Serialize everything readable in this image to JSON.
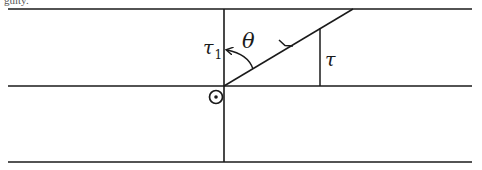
{
  "caption": "guity.",
  "diagram": {
    "labels": {
      "theta": "θ",
      "tau1_main": "τ",
      "tau1_sub": "1",
      "tau": "τ"
    },
    "elements": {
      "horizontal_lines": [
        {
          "name": "top-boundary",
          "y": 9,
          "x1": 8,
          "x2": 472
        },
        {
          "name": "middle-boundary",
          "y": 86,
          "x1": 8,
          "x2": 472
        },
        {
          "name": "bottom-boundary",
          "y": 162,
          "x1": 8,
          "x2": 472
        }
      ],
      "vertical_axis": {
        "x": 224,
        "y1": 9,
        "y2": 162
      },
      "diagonal_ray": {
        "x1": 353,
        "y1": 9,
        "x2": 224,
        "y2": 86,
        "arrow_direction": "down-left"
      },
      "tau_projection": {
        "x": 320,
        "y1": 28,
        "y2": 86
      },
      "angle_arc": {
        "from": "diagonal",
        "to": "vertical",
        "arrowhead_at": "vertical"
      },
      "out_of_page_symbol": {
        "x": 216,
        "y": 97,
        "meaning": "vector pointing out of page"
      }
    },
    "stroke_color": "#1a1a1a",
    "background": "#ffffff"
  }
}
